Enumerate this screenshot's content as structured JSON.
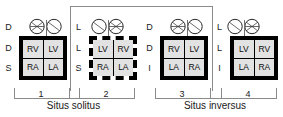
{
  "figure": {
    "type": "cardiac-situs-diagram",
    "caption_left": "Situs solitus",
    "caption_right": "Situs inversus"
  },
  "legend_axes": {
    "row_labels_meaning": [
      "bronchial/pulmonary situs",
      "ventricular loop",
      "atrial situs"
    ]
  },
  "panels": [
    {
      "number": "1",
      "side_letters": [
        "D",
        "D",
        "S"
      ],
      "border_style": "solid",
      "lungs": {
        "trilobed_side": "left",
        "bilobed_side": "right"
      },
      "chambers": {
        "top_left": "RV",
        "top_right": "LV",
        "bottom_left": "RA",
        "bottom_right": "LA"
      }
    },
    {
      "number": "2",
      "side_letters": [
        "L",
        "L",
        "S"
      ],
      "border_style": "dashed",
      "lungs": {
        "trilobed_side": "left",
        "bilobed_side": "right"
      },
      "chambers": {
        "top_left": "LV",
        "top_right": "RV",
        "bottom_left": "RA",
        "bottom_right": "LA"
      }
    },
    {
      "number": "3",
      "side_letters": [
        "D",
        "D",
        "I"
      ],
      "border_style": "solid",
      "lungs": {
        "trilobed_side": "left",
        "bilobed_side": "right"
      },
      "chambers": {
        "top_left": "RV",
        "top_right": "LV",
        "bottom_left": "LA",
        "bottom_right": "RA"
      }
    },
    {
      "number": "4",
      "side_letters": [
        "L",
        "L",
        "I"
      ],
      "border_style": "solid",
      "lungs": {
        "trilobed_side": "right",
        "bilobed_side": "left"
      },
      "chambers": {
        "top_left": "LV",
        "top_right": "RV",
        "bottom_left": "LA",
        "bottom_right": "RA"
      }
    }
  ],
  "colors": {
    "ink": "#000000",
    "cell_fill": "#e2e2e2",
    "bracket": "#8a8a8a",
    "background": "#ffffff"
  }
}
